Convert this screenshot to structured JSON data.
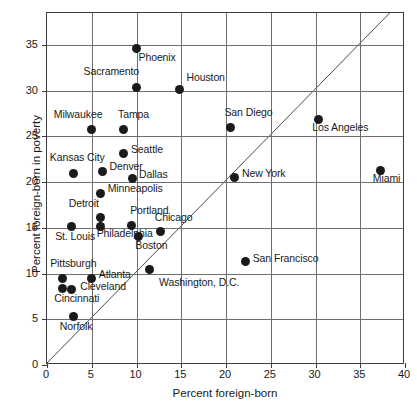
{
  "chart_data": {
    "type": "scatter",
    "title": "",
    "xlabel": "Percent foreign-born",
    "ylabel": "Percent foreign-born in poverty",
    "xlim": [
      0,
      40
    ],
    "ylim": [
      0,
      38.5
    ],
    "xticks": [
      0,
      5,
      10,
      15,
      20,
      25,
      30,
      35,
      40
    ],
    "yticks": [
      0,
      5,
      10,
      15,
      20,
      25,
      30,
      35
    ],
    "xtick_labels": [
      "0",
      "5",
      "10",
      "15",
      "20",
      "25",
      "30",
      "35",
      "40"
    ],
    "ytick_labels": [
      "0",
      "5",
      "10",
      "15",
      "20",
      "25",
      "30",
      "35"
    ],
    "grid": true,
    "legend": "none",
    "annotations": [
      {
        "name": "identity-line",
        "description": "y = x reference diagonal from (0,0) to (38.5,38.5)"
      }
    ],
    "points": [
      {
        "label": "Phoenix",
        "x": 10.0,
        "y": 34.6,
        "label_dx": 2,
        "label_dy": 8
      },
      {
        "label": "Sacramento",
        "x": 10.0,
        "y": 30.4,
        "label_dx": -53,
        "label_dy": -16
      },
      {
        "label": "Houston",
        "x": 14.8,
        "y": 30.1,
        "label_dx": 7,
        "label_dy": -13
      },
      {
        "label": "Milwaukee",
        "x": 5.0,
        "y": 25.8,
        "label_dx": -38,
        "label_dy": -15
      },
      {
        "label": "Tampa",
        "x": 8.5,
        "y": 25.8,
        "label_dx": -5,
        "label_dy": -15
      },
      {
        "label": "Los Angeles",
        "x": 30.3,
        "y": 26.9,
        "label_dx": -6,
        "label_dy": 8
      },
      {
        "label": "San Diego",
        "x": 20.5,
        "y": 26.0,
        "label_dx": -6,
        "label_dy": -15
      },
      {
        "label": "Seattle",
        "x": 8.6,
        "y": 23.1,
        "label_dx": 7,
        "label_dy": -5
      },
      {
        "label": "Denver",
        "x": 6.2,
        "y": 21.2,
        "label_dx": 7,
        "label_dy": -5
      },
      {
        "label": "Kansas City",
        "x": 3.0,
        "y": 21.0,
        "label_dx": -24,
        "label_dy": -16
      },
      {
        "label": "Dallas",
        "x": 9.5,
        "y": 20.4,
        "label_dx": 7,
        "label_dy": -4
      },
      {
        "label": "New York",
        "x": 21.0,
        "y": 20.5,
        "label_dx": 7,
        "label_dy": -5
      },
      {
        "label": "Miami",
        "x": 37.3,
        "y": 21.3,
        "label_dx": -8,
        "label_dy": 8
      },
      {
        "label": "Minneapolis",
        "x": 6.0,
        "y": 18.8,
        "label_dx": 7,
        "label_dy": -5
      },
      {
        "label": "Detroit",
        "x": 6.0,
        "y": 16.1,
        "label_dx": -32,
        "label_dy": -15
      },
      {
        "label": "Portland",
        "x": 9.4,
        "y": 15.3,
        "label_dx": -1,
        "label_dy": -15
      },
      {
        "label": "Chicago",
        "x": 12.7,
        "y": 14.6,
        "label_dx": -6,
        "label_dy": -15
      },
      {
        "label": "Philadelphia",
        "x": 6.0,
        "y": 15.2,
        "label_dx": -4,
        "label_dy": 7
      },
      {
        "label": "St. Louis",
        "x": 2.7,
        "y": 15.2,
        "label_dx": -16,
        "label_dy": 10
      },
      {
        "label": "Boston",
        "x": 10.2,
        "y": 14.1,
        "label_dx": -3,
        "label_dy": 9
      },
      {
        "label": "Washington, D.C.",
        "x": 11.4,
        "y": 10.4,
        "label_dx": 10,
        "label_dy": 12
      },
      {
        "label": "San Francisco",
        "x": 22.2,
        "y": 11.3,
        "label_dx": 7,
        "label_dy": -4
      },
      {
        "label": "Pittsburgh",
        "x": 1.7,
        "y": 9.5,
        "label_dx": -12,
        "label_dy": -15
      },
      {
        "label": "Atlanta",
        "x": 5.0,
        "y": 9.5,
        "label_dx": 7,
        "label_dy": -4
      },
      {
        "label": "Cincinnati",
        "x": 1.7,
        "y": 8.4,
        "label_dx": -8,
        "label_dy": 10
      },
      {
        "label": "Cleveland",
        "x": 2.7,
        "y": 8.3,
        "label_dx": 9,
        "label_dy": -3
      },
      {
        "label": "Norfolk",
        "x": 3.0,
        "y": 5.3,
        "label_dx": -14,
        "label_dy": 9
      }
    ]
  }
}
